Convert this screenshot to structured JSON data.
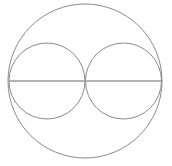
{
  "figure": {
    "type": "geometric-diagram",
    "background_color": "#ffffff",
    "canvas": {
      "width": 172,
      "height": 166
    },
    "stroke": {
      "color": "#8a8a8a",
      "line_color": "#9a9a9a",
      "width": 1
    },
    "shapes": [
      {
        "name": "outer-circle",
        "kind": "circle",
        "cx": 85,
        "cy": 81,
        "r": 77,
        "stroke_color": "#8a8a8a",
        "stroke_width": 1,
        "fill": "none"
      },
      {
        "name": "left-inner-circle",
        "kind": "circle",
        "cx": 47,
        "cy": 81,
        "r": 38,
        "stroke_color": "#8a8a8a",
        "stroke_width": 1,
        "fill": "none"
      },
      {
        "name": "right-inner-circle",
        "kind": "circle",
        "cx": 123.5,
        "cy": 81,
        "r": 38,
        "stroke_color": "#8a8a8a",
        "stroke_width": 1,
        "fill": "none"
      },
      {
        "name": "horizontal-diameter-line",
        "kind": "line",
        "x1": 9,
        "y1": 81,
        "x2": 161,
        "y2": 81,
        "stroke_color": "#9a9a9a",
        "stroke_width": 1.4
      }
    ]
  }
}
